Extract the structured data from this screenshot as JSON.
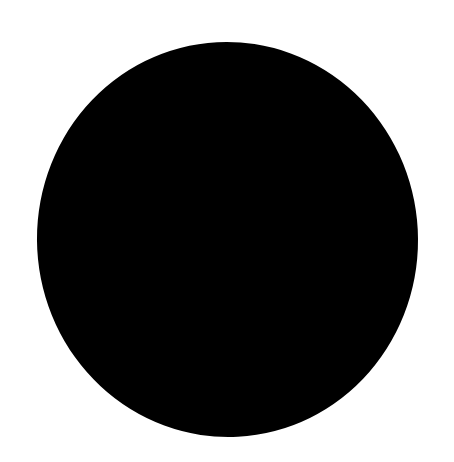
{
  "canvas": {
    "width": 454,
    "height": 462,
    "background_color": "#ffffff"
  },
  "shape": {
    "type": "ellipse",
    "fill_color": "#000000",
    "left": 37,
    "top": 42,
    "width": 381,
    "height": 395
  }
}
